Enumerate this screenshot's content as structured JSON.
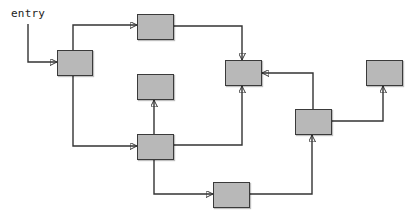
{
  "diagram": {
    "type": "control-flow-graph",
    "entry_label": "entry",
    "colors": {
      "background": "#ffffff",
      "node_fill": "#b8b8b8",
      "node_border": "#3a3a3a",
      "edge": "#333333"
    },
    "nodes": [
      {
        "id": "A",
        "x": 57,
        "y": 50,
        "w": 36,
        "h": 26
      },
      {
        "id": "B",
        "x": 137,
        "y": 14,
        "w": 37,
        "h": 26
      },
      {
        "id": "C",
        "x": 137,
        "y": 74,
        "w": 37,
        "h": 26
      },
      {
        "id": "D",
        "x": 137,
        "y": 134,
        "w": 37,
        "h": 26
      },
      {
        "id": "E",
        "x": 225,
        "y": 60,
        "w": 37,
        "h": 26
      },
      {
        "id": "F",
        "x": 366,
        "y": 60,
        "w": 37,
        "h": 26
      },
      {
        "id": "G",
        "x": 295,
        "y": 109,
        "w": 37,
        "h": 26
      },
      {
        "id": "H",
        "x": 213,
        "y": 182,
        "w": 37,
        "h": 26
      }
    ],
    "edges": [
      {
        "from": "entry",
        "to": "A",
        "points": [
          [
            28,
            24
          ],
          [
            28,
            62
          ],
          [
            57,
            62
          ]
        ]
      },
      {
        "from": "A",
        "to": "B",
        "points": [
          [
            73,
            50
          ],
          [
            73,
            25
          ],
          [
            137,
            25
          ]
        ]
      },
      {
        "from": "A",
        "to": "D",
        "points": [
          [
            73,
            76
          ],
          [
            73,
            146
          ],
          [
            137,
            146
          ]
        ]
      },
      {
        "from": "B",
        "to": "E",
        "points": [
          [
            174,
            26
          ],
          [
            242,
            26
          ],
          [
            242,
            60
          ]
        ]
      },
      {
        "from": "D",
        "to": "C",
        "points": [
          [
            154,
            134
          ],
          [
            154,
            100
          ]
        ]
      },
      {
        "from": "D",
        "to": "E",
        "points": [
          [
            174,
            145
          ],
          [
            242,
            145
          ],
          [
            242,
            86
          ]
        ]
      },
      {
        "from": "D",
        "to": "H",
        "points": [
          [
            154,
            160
          ],
          [
            154,
            194
          ],
          [
            213,
            194
          ]
        ]
      },
      {
        "from": "H",
        "to": "G",
        "points": [
          [
            250,
            194
          ],
          [
            312,
            194
          ],
          [
            312,
            135
          ]
        ]
      },
      {
        "from": "G",
        "to": "E",
        "points": [
          [
            313,
            109
          ],
          [
            313,
            73
          ],
          [
            262,
            73
          ]
        ]
      },
      {
        "from": "G",
        "to": "F",
        "points": [
          [
            332,
            121
          ],
          [
            383,
            121
          ],
          [
            383,
            86
          ]
        ]
      }
    ]
  }
}
